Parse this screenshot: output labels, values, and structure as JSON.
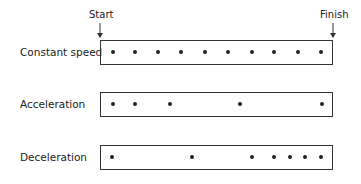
{
  "markers": {
    "start": "Start",
    "finish": "Finish"
  },
  "rows": [
    {
      "label": "Constant speed",
      "top": 40,
      "dots": [
        113,
        135,
        158,
        181,
        205,
        228,
        252,
        274,
        298,
        321
      ]
    },
    {
      "label": "Acceleration",
      "top": 92,
      "dots": [
        113,
        135,
        170,
        240,
        322
      ]
    },
    {
      "label": "Deceleration",
      "top": 145,
      "dots": [
        112,
        192,
        252,
        274,
        290,
        305,
        321
      ]
    }
  ]
}
